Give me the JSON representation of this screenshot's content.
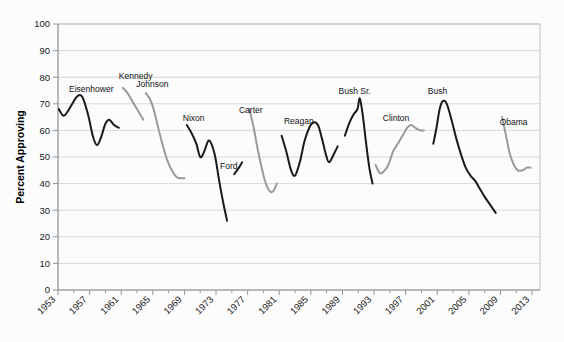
{
  "chart_data": {
    "type": "line",
    "title": "",
    "xlabel": "",
    "ylabel": "Percent Approving",
    "ylim": [
      0,
      100
    ],
    "ytick_step": 10,
    "yticks": [
      "0",
      "10",
      "20",
      "30",
      "40",
      "50",
      "60",
      "70",
      "80",
      "90",
      "100"
    ],
    "xlim": [
      1953,
      2014
    ],
    "xticks": [
      "1953",
      "1957",
      "1961",
      "1965",
      "1969",
      "1973",
      "1977",
      "1981",
      "1985",
      "1989",
      "1993",
      "1997",
      "2001",
      "2005",
      "2009",
      "2013"
    ],
    "grid": true,
    "legend": "none",
    "annotations_style": "inline-series-labels",
    "colors": {
      "series_dark": "#1a1a1a",
      "series_light": "#9a9a9a",
      "gridline": "#c9c9c9",
      "plot_border": "#b4b4b4",
      "background": "#fcfcfc"
    },
    "series": [
      {
        "name": "Eisenhower",
        "color": "#1a1a1a",
        "label_x": 1954.4,
        "label_y": 74.5,
        "points": [
          [
            1953.1,
            68
          ],
          [
            1953.7,
            65.5
          ],
          [
            1954.2,
            67
          ],
          [
            1954.9,
            70.5
          ],
          [
            1955.5,
            73
          ],
          [
            1956.1,
            72.5
          ],
          [
            1956.8,
            66
          ],
          [
            1957.4,
            58
          ],
          [
            1957.9,
            54.5
          ],
          [
            1958.4,
            57
          ],
          [
            1959.0,
            62.5
          ],
          [
            1959.5,
            64
          ],
          [
            1960.1,
            62
          ],
          [
            1960.7,
            61
          ]
        ]
      },
      {
        "name": "Kennedy",
        "color": "#9a9a9a",
        "label_x": 1960.7,
        "label_y": 79.5,
        "points": [
          [
            1961.2,
            76
          ],
          [
            1961.8,
            74
          ],
          [
            1962.4,
            71
          ],
          [
            1962.9,
            68.5
          ],
          [
            1963.4,
            66
          ],
          [
            1963.8,
            64
          ]
        ]
      },
      {
        "name": "Johnson",
        "color": "#9a9a9a",
        "label_x": 1962.9,
        "label_y": 76.5,
        "points": [
          [
            1964.1,
            74
          ],
          [
            1964.6,
            72
          ],
          [
            1965.1,
            68
          ],
          [
            1965.6,
            62
          ],
          [
            1966.2,
            55
          ],
          [
            1966.8,
            49
          ],
          [
            1967.4,
            45
          ],
          [
            1968.0,
            42.5
          ],
          [
            1968.6,
            42
          ],
          [
            1969.0,
            42
          ]
        ]
      },
      {
        "name": "Nixon",
        "color": "#1a1a1a",
        "label_x": 1968.8,
        "label_y": 63.5,
        "points": [
          [
            1969.3,
            62
          ],
          [
            1969.9,
            59
          ],
          [
            1970.5,
            55
          ],
          [
            1971.0,
            50
          ],
          [
            1971.5,
            52
          ],
          [
            1972.0,
            56
          ],
          [
            1972.4,
            55
          ],
          [
            1972.9,
            50
          ],
          [
            1973.4,
            41
          ],
          [
            1973.9,
            33
          ],
          [
            1974.4,
            26
          ]
        ]
      },
      {
        "name": "Ford",
        "color": "#1a1a1a",
        "label_x": 1973.5,
        "label_y": 45.5,
        "points": [
          [
            1975.3,
            43.5
          ],
          [
            1975.9,
            46
          ],
          [
            1976.3,
            48
          ]
        ]
      },
      {
        "name": "Carter",
        "color": "#9a9a9a",
        "label_x": 1975.9,
        "label_y": 66.5,
        "points": [
          [
            1977.2,
            68
          ],
          [
            1977.7,
            62
          ],
          [
            1978.2,
            54
          ],
          [
            1978.7,
            47
          ],
          [
            1979.2,
            41
          ],
          [
            1979.7,
            37.5
          ],
          [
            1980.2,
            37
          ],
          [
            1980.7,
            40
          ]
        ]
      },
      {
        "name": "Reagan",
        "color": "#1a1a1a",
        "label_x": 1981.6,
        "label_y": 62.5,
        "points": [
          [
            1981.3,
            58
          ],
          [
            1981.9,
            52
          ],
          [
            1982.5,
            45
          ],
          [
            1983.0,
            43
          ],
          [
            1983.6,
            48
          ],
          [
            1984.2,
            56
          ],
          [
            1984.8,
            61
          ],
          [
            1985.3,
            63
          ],
          [
            1985.9,
            62
          ],
          [
            1986.4,
            57
          ],
          [
            1986.9,
            51
          ],
          [
            1987.3,
            48
          ],
          [
            1987.9,
            51
          ],
          [
            1988.4,
            54
          ]
        ]
      },
      {
        "name": "Bush Sr.",
        "color": "#1a1a1a",
        "label_x": 1988.5,
        "label_y": 73.5,
        "points": [
          [
            1989.3,
            58
          ],
          [
            1989.9,
            63
          ],
          [
            1990.4,
            66
          ],
          [
            1990.9,
            68
          ],
          [
            1991.2,
            72
          ],
          [
            1991.6,
            65
          ],
          [
            1992.0,
            55
          ],
          [
            1992.4,
            46
          ],
          [
            1992.8,
            40
          ]
        ]
      },
      {
        "name": "Clinton",
        "color": "#9a9a9a",
        "label_x": 1994.1,
        "label_y": 63.5,
        "points": [
          [
            1993.2,
            47
          ],
          [
            1993.7,
            44
          ],
          [
            1994.2,
            44.5
          ],
          [
            1994.8,
            47
          ],
          [
            1995.4,
            52
          ],
          [
            1996.0,
            55
          ],
          [
            1996.6,
            58
          ],
          [
            1997.2,
            61
          ],
          [
            1997.7,
            62
          ],
          [
            1998.2,
            61
          ],
          [
            1998.8,
            60
          ],
          [
            1999.3,
            60
          ]
        ]
      },
      {
        "name": "Bush",
        "color": "#1a1a1a",
        "label_x": 1999.8,
        "label_y": 73.5,
        "points": [
          [
            2000.5,
            55
          ],
          [
            2000.9,
            61
          ],
          [
            2001.3,
            68
          ],
          [
            2001.7,
            71
          ],
          [
            2002.2,
            70
          ],
          [
            2002.8,
            64
          ],
          [
            2003.4,
            57
          ],
          [
            2004.0,
            51
          ],
          [
            2004.6,
            46
          ],
          [
            2005.2,
            43
          ],
          [
            2005.8,
            41
          ],
          [
            2006.4,
            38
          ],
          [
            2007.0,
            35
          ],
          [
            2007.7,
            32
          ],
          [
            2008.4,
            29
          ]
        ]
      },
      {
        "name": "Obama",
        "color": "#9a9a9a",
        "label_x": 2008.9,
        "label_y": 62.0,
        "points": [
          [
            2009.2,
            65
          ],
          [
            2009.7,
            58
          ],
          [
            2010.2,
            51
          ],
          [
            2010.7,
            47
          ],
          [
            2011.2,
            45
          ],
          [
            2011.8,
            45
          ],
          [
            2012.3,
            46
          ],
          [
            2012.8,
            46
          ]
        ]
      }
    ]
  }
}
